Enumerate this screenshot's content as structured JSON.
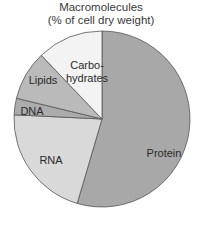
{
  "chart_data": {
    "type": "pie",
    "title": "Macromolecules",
    "subtitle": "(% of cell dry weight)",
    "start_angle_deg": 0,
    "direction": "clockwise",
    "slices": [
      {
        "label": "Protein",
        "value": 54,
        "color": "#a8a8a8"
      },
      {
        "label": "RNA",
        "value": 21,
        "color": "#d9d9d9"
      },
      {
        "label": "DNA",
        "value": 3,
        "color": "#acacac"
      },
      {
        "label": "Lipids",
        "value": 9,
        "color": "#bababa"
      },
      {
        "label": "Carbohydrates",
        "value": 12,
        "color": "#f3f3f3"
      }
    ],
    "display_labels": [
      "Protein",
      "RNA",
      "DNA",
      "Lipids",
      "Carbo-",
      "hydrates"
    ]
  }
}
